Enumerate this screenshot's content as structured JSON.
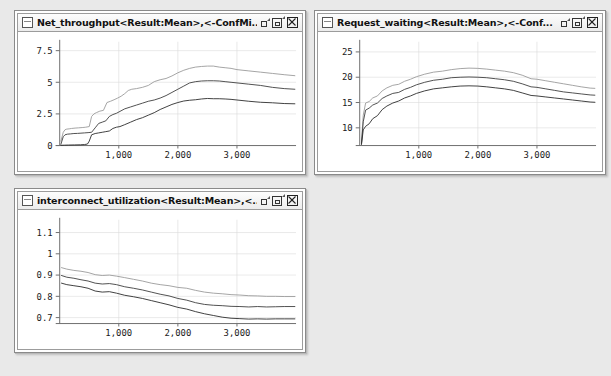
{
  "desktop": {
    "background_color": "#e9e9e9"
  },
  "window_controls": {
    "minimize_label": "Minimize",
    "maximize_label": "Maximize",
    "close_label": "Close",
    "icons": [
      "minimize-icon",
      "maximize-icon",
      "close-icon"
    ],
    "document_icon": "document-icon"
  },
  "windows": [
    {
      "id": "net-throughput",
      "title": "Net_throughput<Result:Mean>,<-ConfMi...",
      "x": 14,
      "y": 10,
      "width": 292,
      "height": 165
    },
    {
      "id": "request-waiting",
      "title": "Request_waiting<Result:Mean>,<-Conf...",
      "x": 314,
      "y": 10,
      "width": 292,
      "height": 165
    },
    {
      "id": "interconnect-utilization",
      "title": "interconnect_utilization<Result:Mean>,<...",
      "x": 14,
      "y": 188,
      "width": 292,
      "height": 165
    }
  ],
  "chart_data": [
    {
      "id": "net-throughput",
      "type": "line",
      "title": "Net_throughput<Result:Mean>,<-ConfMi...",
      "xlabel": "",
      "ylabel": "",
      "xlim": [
        0,
        4000
      ],
      "ylim": [
        0,
        8.2
      ],
      "xticks": [
        1000,
        2000,
        3000
      ],
      "xticklabels": [
        "1,000",
        "2,000",
        "3,000"
      ],
      "yticks": [
        0,
        2.5,
        5,
        7.5
      ],
      "yticklabels": [
        "0",
        "2.5",
        "5",
        "7.5"
      ],
      "grid": true,
      "legend": "none",
      "series": [
        {
          "name": "upper-confidence",
          "color": "#9a9a9a",
          "x": [
            20,
            60,
            90,
            120,
            160,
            200,
            260,
            320,
            380,
            440,
            500,
            540,
            580,
            620,
            680,
            740,
            800,
            860,
            920,
            980,
            1040,
            1100,
            1160,
            1220,
            1300,
            1400,
            1500,
            1600,
            1700,
            1800,
            1900,
            2000,
            2100,
            2200,
            2300,
            2400,
            2500,
            2600,
            2700,
            2800,
            2900,
            3000,
            3200,
            3400,
            3600,
            3800,
            3980
          ],
          "y": [
            0.35,
            1.05,
            1.25,
            1.3,
            1.32,
            1.35,
            1.38,
            1.4,
            1.42,
            1.45,
            1.5,
            2.3,
            2.5,
            2.6,
            2.72,
            2.78,
            3.4,
            3.5,
            3.62,
            3.75,
            3.9,
            4.1,
            4.35,
            4.45,
            4.5,
            4.6,
            4.75,
            5.05,
            5.2,
            5.3,
            5.5,
            5.75,
            5.95,
            6.1,
            6.2,
            6.25,
            6.28,
            6.28,
            6.2,
            6.15,
            6.1,
            6.0,
            5.9,
            5.8,
            5.7,
            5.6,
            5.52
          ]
        },
        {
          "name": "mean",
          "color": "#3c3c3c",
          "x": [
            20,
            60,
            90,
            130,
            180,
            240,
            300,
            360,
            420,
            480,
            540,
            600,
            660,
            720,
            780,
            840,
            900,
            960,
            1020,
            1100,
            1200,
            1300,
            1400,
            1500,
            1600,
            1700,
            1800,
            1900,
            2000,
            2100,
            2200,
            2300,
            2400,
            2500,
            2600,
            2700,
            2800,
            2900,
            3000,
            3200,
            3400,
            3600,
            3800,
            3980
          ],
          "y": [
            0.1,
            0.7,
            0.85,
            0.9,
            0.92,
            0.95,
            0.96,
            0.98,
            1.0,
            1.02,
            1.05,
            1.4,
            1.75,
            1.85,
            1.95,
            2.3,
            2.45,
            2.55,
            2.7,
            2.9,
            3.05,
            3.2,
            3.35,
            3.5,
            3.6,
            3.75,
            3.95,
            4.2,
            4.45,
            4.7,
            4.95,
            5.05,
            5.1,
            5.12,
            5.12,
            5.1,
            5.05,
            5.0,
            4.95,
            4.85,
            4.75,
            4.6,
            4.5,
            4.45
          ]
        },
        {
          "name": "lower-confidence",
          "color": "#2a2a2a",
          "x": [
            20,
            80,
            150,
            250,
            350,
            420,
            470,
            500,
            540,
            600,
            660,
            720,
            780,
            840,
            900,
            960,
            1020,
            1100,
            1200,
            1300,
            1400,
            1500,
            1600,
            1700,
            1800,
            1900,
            2000,
            2100,
            2200,
            2300,
            2400,
            2500,
            2600,
            2700,
            2800,
            2900,
            3000,
            3200,
            3400,
            3600,
            3800,
            3980
          ],
          "y": [
            0.02,
            0.03,
            0.04,
            0.05,
            0.06,
            0.08,
            0.12,
            0.35,
            0.85,
            0.95,
            1.0,
            1.05,
            1.1,
            1.15,
            1.35,
            1.45,
            1.5,
            1.65,
            1.85,
            2.05,
            2.2,
            2.4,
            2.6,
            2.85,
            3.05,
            3.25,
            3.4,
            3.52,
            3.58,
            3.62,
            3.68,
            3.72,
            3.7,
            3.7,
            3.68,
            3.65,
            3.6,
            3.5,
            3.42,
            3.38,
            3.32,
            3.3
          ]
        }
      ]
    },
    {
      "id": "request-waiting",
      "type": "line",
      "title": "Request_waiting<Result:Mean>,<-Conf...",
      "xlabel": "",
      "ylabel": "",
      "xlim": [
        0,
        4000
      ],
      "ylim": [
        6.5,
        27
      ],
      "xticks": [
        1000,
        2000,
        3000
      ],
      "xticklabels": [
        "1,000",
        "2,000",
        "3,000"
      ],
      "yticks": [
        10,
        15,
        20,
        25
      ],
      "yticklabels": [
        "10",
        "15",
        "20",
        "25"
      ],
      "grid": true,
      "legend": "none",
      "series": [
        {
          "name": "upper-confidence",
          "color": "#9a9a9a",
          "x": [
            30,
            60,
            100,
            160,
            220,
            300,
            380,
            460,
            560,
            660,
            760,
            860,
            960,
            1100,
            1250,
            1400,
            1550,
            1700,
            1850,
            2000,
            2150,
            2300,
            2450,
            2600,
            2750,
            2900,
            3000,
            3150,
            3300,
            3450,
            3600,
            3750,
            3900,
            3980
          ],
          "y": [
            7.1,
            12.5,
            14.9,
            15.2,
            15.9,
            16.3,
            17.3,
            17.9,
            18.4,
            18.6,
            19.2,
            19.6,
            20.1,
            20.6,
            21.0,
            21.2,
            21.5,
            21.7,
            21.8,
            21.75,
            21.6,
            21.4,
            21.2,
            20.9,
            20.4,
            19.7,
            19.6,
            19.3,
            19.0,
            18.7,
            18.4,
            18.1,
            17.85,
            17.8
          ]
        },
        {
          "name": "mean",
          "color": "#3c3c3c",
          "x": [
            30,
            60,
            100,
            160,
            220,
            300,
            380,
            460,
            560,
            660,
            760,
            860,
            960,
            1100,
            1250,
            1400,
            1550,
            1700,
            1850,
            2000,
            2150,
            2300,
            2450,
            2600,
            2750,
            2900,
            3000,
            3150,
            3300,
            3450,
            3600,
            3750,
            3900,
            3980
          ],
          "y": [
            6.9,
            11.2,
            13.5,
            13.9,
            14.5,
            14.9,
            15.8,
            16.3,
            16.8,
            17.0,
            17.6,
            18.0,
            18.5,
            19.0,
            19.4,
            19.6,
            19.9,
            20.0,
            20.05,
            20.0,
            19.9,
            19.7,
            19.5,
            19.2,
            18.7,
            18.1,
            18.0,
            17.7,
            17.4,
            17.1,
            16.9,
            16.7,
            16.5,
            16.45
          ]
        },
        {
          "name": "lower-confidence",
          "color": "#2a2a2a",
          "x": [
            30,
            60,
            100,
            160,
            220,
            300,
            380,
            460,
            560,
            660,
            760,
            860,
            960,
            1100,
            1250,
            1400,
            1550,
            1700,
            1850,
            2000,
            2150,
            2300,
            2450,
            2600,
            2750,
            2900,
            3000,
            3150,
            3300,
            3450,
            3600,
            3750,
            3900,
            3980
          ],
          "y": [
            6.7,
            9.6,
            10.3,
            10.8,
            11.8,
            12.4,
            13.6,
            14.3,
            14.9,
            15.3,
            15.9,
            16.3,
            16.8,
            17.3,
            17.7,
            17.9,
            18.1,
            18.25,
            18.3,
            18.25,
            18.1,
            17.9,
            17.7,
            17.4,
            16.9,
            16.4,
            16.3,
            16.1,
            15.9,
            15.7,
            15.5,
            15.3,
            15.1,
            15.05
          ]
        }
      ]
    },
    {
      "id": "interconnect-utilization",
      "type": "line",
      "title": "interconnect_utilization<Result:Mean>,<...",
      "xlabel": "",
      "ylabel": "",
      "xlim": [
        0,
        4000
      ],
      "ylim": [
        0.672,
        1.16
      ],
      "xticks": [
        1000,
        2000,
        3000
      ],
      "xticklabels": [
        "1,000",
        "2,000",
        "3,000"
      ],
      "yticks": [
        0.7,
        0.8,
        0.9,
        1,
        1.1
      ],
      "yticklabels": [
        "0.7",
        "0.8",
        "0.9",
        "1",
        "1.1"
      ],
      "grid": true,
      "legend": "none",
      "series": [
        {
          "name": "upper-confidence",
          "color": "#9a9a9a",
          "x": [
            30,
            120,
            240,
            360,
            480,
            600,
            720,
            840,
            960,
            1100,
            1250,
            1400,
            1550,
            1700,
            1850,
            2000,
            2150,
            2300,
            2450,
            2600,
            2750,
            2900,
            3050,
            3200,
            3350,
            3500,
            3650,
            3800,
            3980
          ],
          "y": [
            0.935,
            0.928,
            0.922,
            0.918,
            0.912,
            0.902,
            0.898,
            0.9,
            0.895,
            0.888,
            0.88,
            0.872,
            0.862,
            0.855,
            0.85,
            0.842,
            0.838,
            0.828,
            0.82,
            0.815,
            0.812,
            0.808,
            0.806,
            0.803,
            0.802,
            0.8,
            0.8,
            0.799,
            0.799
          ]
        },
        {
          "name": "mean",
          "color": "#3c3c3c",
          "x": [
            30,
            120,
            240,
            360,
            480,
            600,
            720,
            840,
            960,
            1100,
            1250,
            1400,
            1550,
            1700,
            1850,
            2000,
            2150,
            2300,
            2450,
            2600,
            2750,
            2900,
            3050,
            3200,
            3350,
            3500,
            3650,
            3800,
            3980
          ],
          "y": [
            0.898,
            0.89,
            0.885,
            0.878,
            0.872,
            0.862,
            0.858,
            0.86,
            0.855,
            0.845,
            0.838,
            0.83,
            0.82,
            0.81,
            0.802,
            0.79,
            0.782,
            0.77,
            0.762,
            0.758,
            0.756,
            0.753,
            0.752,
            0.75,
            0.752,
            0.75,
            0.751,
            0.752,
            0.752
          ]
        },
        {
          "name": "lower-confidence",
          "color": "#2a2a2a",
          "x": [
            30,
            120,
            240,
            360,
            480,
            600,
            720,
            840,
            960,
            1100,
            1250,
            1400,
            1550,
            1700,
            1850,
            2000,
            2150,
            2300,
            2450,
            2600,
            2750,
            2900,
            3050,
            3200,
            3350,
            3500,
            3650,
            3800,
            3980
          ],
          "y": [
            0.862,
            0.855,
            0.85,
            0.845,
            0.838,
            0.825,
            0.82,
            0.822,
            0.815,
            0.805,
            0.798,
            0.79,
            0.78,
            0.77,
            0.76,
            0.748,
            0.74,
            0.728,
            0.718,
            0.71,
            0.702,
            0.697,
            0.695,
            0.693,
            0.694,
            0.693,
            0.694,
            0.694,
            0.694
          ]
        }
      ]
    }
  ]
}
